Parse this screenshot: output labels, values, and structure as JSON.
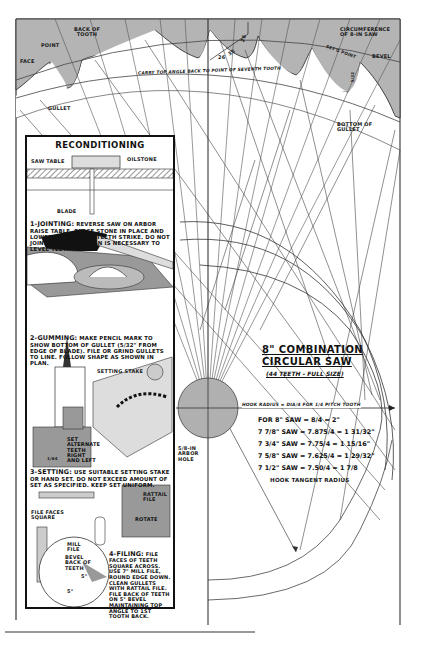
{
  "diagram": {
    "title_line1": "8\" COMBINATION",
    "title_line2": "CIRCULAR SAW",
    "subtitle": "(44 TEETH - FULL SIZE)"
  },
  "tooth_labels": {
    "back_of_tooth": "BACK OF TOOTH",
    "point": "POINT",
    "face": "FACE",
    "gullet": "GULLET",
    "carry_line": "CARRY TOP ANGLE BACK TO POINT OF SEVENTH TOOTH",
    "circumference": "CIRCUMFERENCE OF 8-IN SAW",
    "set_point": "SET'G POINT",
    "bevel": "BEVEL",
    "bottom_of_gullet": "BOTTOM OF GULLET",
    "dim_26a": "26",
    "dim_35": "35",
    "dim_26b": "26",
    "dim_fraction": "5/32"
  },
  "arbor": {
    "label": "5/8-IN ARBOR HOLE"
  },
  "hook": {
    "radius_line": "HOOK RADIUS = DIA/4 FOR 1/4 PITCH TOOTH",
    "tangent_label": "HOOK TANGENT RADIUS",
    "formulas": [
      "FOR 8\" SAW = 8/4 = 2\"",
      "7 7/8\" SAW = 7.875/4 = 1 31/32\"",
      "7 3/4\" SAW = 7.75/4 = 1 15/16\"",
      "7 5/8\" SAW = 7.625/4 = 1 29/32\"",
      "7 1/2\" SAW = 7.50/4 = 1 7/8"
    ]
  },
  "reconditioning": {
    "title": "RECONDITIONING",
    "saw_table": "SAW TABLE",
    "oilstone": "OILSTONE",
    "blade": "BLADE",
    "steps": [
      {
        "head": "1-JOINTING:",
        "body": "REVERSE SAW ON ARBOR RAISE TABLE. PLACE STONE IN PLACE AND LOWER TABLE UNTIL TEETH STRIKE. DO NOT JOINT ANY MORE THAN IS NECESSARY TO LEVEL TEETH."
      },
      {
        "head": "2-GUMMING:",
        "body": "MAKE PENCIL MARK TO SHOW BOTTOM OF GULLET (5/32\" FROM EDGE OF BLADE). FILE OR GRIND GULLETS TO LINE. FOLLOW SHAPE AS SHOWN IN PLAN."
      },
      {
        "head": "3-SETTING:",
        "body": "USE SUITABLE SETTING STAKE OR HAND SET. DO NOT EXCEED AMOUNT OF SET AS SPECIFIED. KEEP SET UNIFORM."
      },
      {
        "head": "4-FILING:",
        "body": "FILE FACES OF TEETH SQUARE ACROSS. USE 7\" MILL FILE, ROUND EDGE DOWN. CLEAN GULLETS WITH RATTAIL FILE. FILE BACK OF TEETH ON 5° BEVEL MAINTAINING TOP ANGLE TO 1st TOOTH BACK."
      }
    ],
    "setting_stake": "SETTING STAKE",
    "set_alternate": "SET ALTERNATE TEETH RIGHT AND LEFT",
    "set_amount": "1/64",
    "file_faces_square": "FILE FACES SQUARE",
    "mill_file": "MILL FILE",
    "rattail_file": "RATTAIL FILE",
    "rotate": "ROTATE",
    "bevel_back": "BEVEL BACK OF TEETH",
    "bevel_deg": "5°",
    "bevel_deg2": "5°"
  },
  "colors": {
    "teeth_fill": "#b4b4b4",
    "line": "#2a2a2a",
    "arbor_fill": "#b0b0b0"
  }
}
